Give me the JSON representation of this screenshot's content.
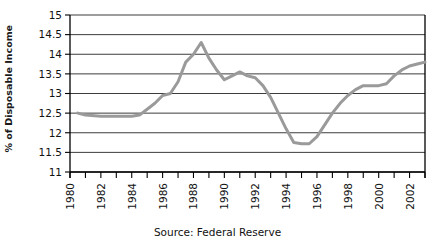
{
  "chart_data": {
    "type": "line",
    "title": "",
    "subtitle": "",
    "xlabel": "",
    "ylabel": "% of Disposable Income",
    "source_note": "Source: Federal Reserve",
    "xlim": [
      1980,
      2003
    ],
    "ylim": [
      11,
      15
    ],
    "x_tick_step": 1,
    "x_label_step": 2,
    "y_tick_step": 0.5,
    "grid": "horizontal",
    "legend": "none",
    "series_color": "#9a9a9a",
    "axis_color": "#000000",
    "grid_color": "#3c3c3c",
    "x_tick_labels": [
      "1980",
      "1982",
      "1984",
      "1986",
      "1988",
      "1990",
      "1992",
      "1994",
      "1996",
      "1998",
      "2000",
      "2002"
    ],
    "y_tick_labels": [
      "11",
      "11.5",
      "12",
      "12.5",
      "13",
      "13.5",
      "14",
      "14.5",
      "15"
    ],
    "series": [
      {
        "name": "Household debt service",
        "x": [
          1980.5,
          1981,
          1982,
          1983,
          1984,
          1984.5,
          1985,
          1985.5,
          1986,
          1986.5,
          1987,
          1987.5,
          1988,
          1988.5,
          1989,
          1989.5,
          1990,
          1990.5,
          1991,
          1991.5,
          1992,
          1992.5,
          1993,
          1993.5,
          1994,
          1994.5,
          1995,
          1995.5,
          1996,
          1996.5,
          1997,
          1997.5,
          1998,
          1998.5,
          1999,
          1999.5,
          2000,
          2000.5,
          2001,
          2001.5,
          2002,
          2002.5,
          2003
        ],
        "values": [
          12.5,
          12.45,
          12.42,
          12.42,
          12.42,
          12.45,
          12.6,
          12.75,
          12.95,
          13.0,
          13.3,
          13.8,
          14.0,
          14.3,
          13.9,
          13.6,
          13.35,
          13.45,
          13.55,
          13.45,
          13.4,
          13.2,
          12.9,
          12.5,
          12.1,
          11.75,
          11.72,
          11.72,
          11.9,
          12.2,
          12.5,
          12.75,
          12.95,
          13.1,
          13.2,
          13.2,
          13.2,
          13.25,
          13.45,
          13.6,
          13.7,
          13.75,
          13.8
        ]
      }
    ]
  },
  "y_axis": {
    "title": "% of Disposable Income"
  },
  "caption": {
    "text": "Source: Federal Reserve"
  }
}
